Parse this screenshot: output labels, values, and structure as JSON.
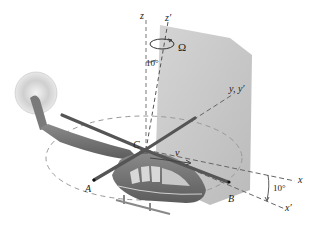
{
  "figure": {
    "type": "helicopter rotor kinematics diagram",
    "axes": {
      "z": "z",
      "z_prime": "z′",
      "y": "y, y′",
      "x": "x",
      "x_prime": "x′"
    },
    "points": {
      "A": "A",
      "B": "B",
      "C": "C"
    },
    "symbols": {
      "omega": "Ω",
      "velocity": "v"
    },
    "angles": {
      "tilt_z": "10°",
      "tilt_x": "10°"
    },
    "colors": {
      "plane": "#b9b9b9",
      "body": "#6f6f6f",
      "blade": "#555555",
      "dash": "#888888",
      "tail_rotor": "#d6d6d6"
    }
  }
}
